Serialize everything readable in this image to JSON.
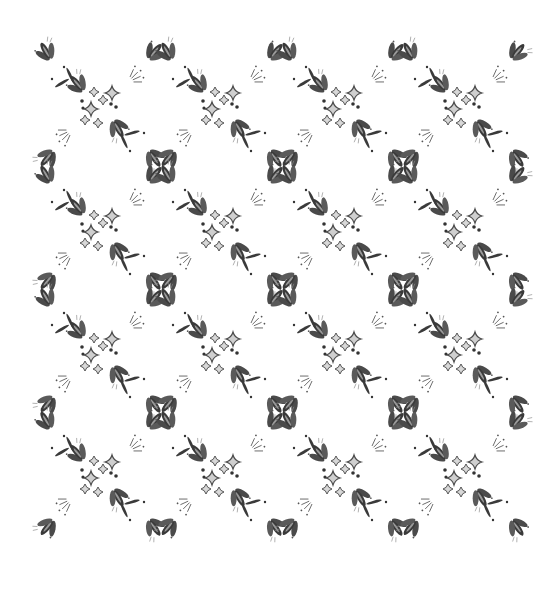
{
  "pattern": {
    "description": "Seamless lattice of X-shaped folk-art motifs",
    "background": "#ffffff",
    "ink_dark": "#3a3a3a",
    "ink_mid": "#6e6e6e",
    "ink_light": "#bdbdbd",
    "rows": 4,
    "cols": 4,
    "origin_x": 100,
    "origin_y": 105,
    "step_x": 121,
    "step_y": 123,
    "arm_length": 62
  }
}
